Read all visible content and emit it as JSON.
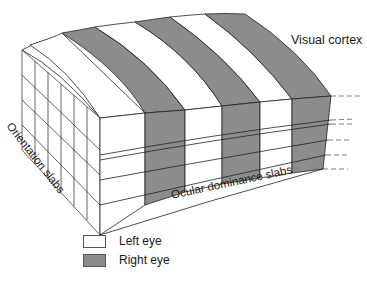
{
  "diagram": {
    "title": "Visual cortex",
    "labels": {
      "orientation": "Orientation slabs",
      "ocular": "Ocular dominance slabs"
    },
    "legend": [
      {
        "label": "Left eye",
        "color": "#ffffff"
      },
      {
        "label": "Right eye",
        "color": "#8c8c8c"
      }
    ],
    "colors": {
      "left_eye": "#ffffff",
      "right_eye": "#8c8c8c",
      "line": "#222222",
      "dash": "#444444"
    },
    "structure": {
      "ocular_dominance_columns": 6,
      "alternating_pattern": [
        "Left eye",
        "Right eye",
        "Left eye",
        "Right eye",
        "Left eye",
        "Right eye"
      ],
      "cortical_layers": 4
    }
  }
}
